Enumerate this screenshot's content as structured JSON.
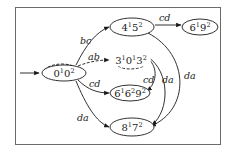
{
  "diagram": {
    "type": "state-transition-graph",
    "start_node": "n0",
    "nodes": [
      {
        "id": "n0",
        "base": [
          "0",
          "0"
        ],
        "exps": [
          "1",
          "2"
        ],
        "label": "0¹0²",
        "cx": 64,
        "cy": 73,
        "rx": 24,
        "ry": 9
      },
      {
        "id": "n1",
        "base": [
          "4",
          "5"
        ],
        "exps": [
          "1",
          "2"
        ],
        "label": "4¹5²",
        "cx": 132,
        "cy": 27,
        "rx": 23,
        "ry": 9
      },
      {
        "id": "n2",
        "base": [
          "6",
          "9"
        ],
        "exps": [
          "1",
          "2"
        ],
        "label": "6¹9²",
        "cx": 200,
        "cy": 27,
        "rx": 18,
        "ry": 9
      },
      {
        "id": "n3",
        "base": [
          "3",
          "0",
          "3"
        ],
        "exps": [
          "1",
          "1",
          "2"
        ],
        "label": "3¹0¹3²",
        "cx": 130,
        "cy": 61,
        "rx": 20,
        "ry": 9
      },
      {
        "id": "n4",
        "base": [
          "6",
          "6",
          "9"
        ],
        "exps": [
          "1",
          "2",
          "2"
        ],
        "label": "6¹6²9²",
        "cx": 130,
        "cy": 93,
        "rx": 20,
        "ry": 9
      },
      {
        "id": "n5",
        "base": [
          "8",
          "7"
        ],
        "exps": [
          "1",
          "2"
        ],
        "label": "8¹7²",
        "cx": 132,
        "cy": 127,
        "rx": 22,
        "ry": 9
      }
    ],
    "edges": [
      {
        "from": "start",
        "to": "n0",
        "label": ""
      },
      {
        "from": "n0",
        "to": "n1",
        "label": "bc"
      },
      {
        "from": "n0",
        "to": "n3",
        "label": "ab",
        "style": "dashed"
      },
      {
        "from": "n0",
        "to": "n4",
        "label": "cd"
      },
      {
        "from": "n0",
        "to": "n5",
        "label": "da"
      },
      {
        "from": "n1",
        "to": "n2",
        "label": "cd"
      },
      {
        "from": "n1",
        "to": "n5",
        "label": "da"
      },
      {
        "from": "n3",
        "to": "n4",
        "label": "cd"
      },
      {
        "from": "n3",
        "to": "n5",
        "label": "da"
      }
    ],
    "edge_labels": {
      "bc": "bc",
      "ab": "ab",
      "cd_0_4": "cd",
      "da_0_5": "da",
      "cd_1_2": "cd",
      "da_1_5": "da",
      "cd_3_4": "cd",
      "da_3_5": "da"
    }
  }
}
